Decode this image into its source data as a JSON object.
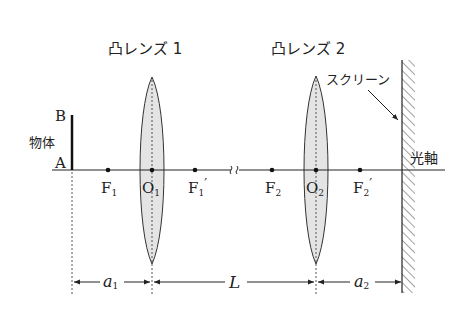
{
  "lens1": {
    "title": "凸レンズ 1",
    "center_label": "O",
    "center_sub": "1"
  },
  "lens2": {
    "title": "凸レンズ 2",
    "center_label": "O",
    "center_sub": "2"
  },
  "object": {
    "label": "物体",
    "top_label": "B",
    "bottom_label": "A"
  },
  "screen": {
    "label": "スクリーン"
  },
  "axis": {
    "label": "光軸"
  },
  "foci": [
    {
      "label": "F",
      "sub": "1",
      "prime": ""
    },
    {
      "label": "F",
      "sub": "1",
      "prime": "′"
    },
    {
      "label": "F",
      "sub": "2",
      "prime": ""
    },
    {
      "label": "F",
      "sub": "2",
      "prime": "′"
    }
  ],
  "dimensions": {
    "a1": {
      "label": "a",
      "sub": "1"
    },
    "L": {
      "label": "L"
    },
    "a2": {
      "label": "a",
      "sub": "2"
    }
  },
  "colors": {
    "line": "#222222",
    "lens_fill": "#e4e4e4",
    "dotted": "#555555"
  }
}
